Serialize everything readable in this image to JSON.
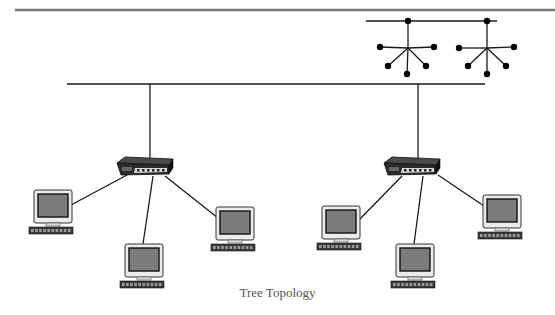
{
  "diagram": {
    "title": "Tree Topology",
    "colors": {
      "top_rule": "#777777",
      "line": "#1a1a1a",
      "node": "#000000",
      "monitor_bezel": "#ececec",
      "monitor_screen": "#7c7c7c",
      "keyboard": "#3a3a3a",
      "hub_body": "#2a2a2a",
      "hub_top": "#4a4a4a",
      "hub_panel": "#d8d8d8"
    },
    "top_rule": {
      "x1": 15,
      "y": 10,
      "x2": 555
    },
    "legend_icon": {
      "bus": {
        "x1": 366,
        "x2": 497,
        "y": 21
      },
      "stars": [
        {
          "top": [
            408,
            21
          ],
          "center": [
            408,
            48
          ],
          "leaves": [
            [
              380,
              47
            ],
            [
              434,
              47
            ],
            [
              388,
              66
            ],
            [
              426,
              66
            ],
            [
              407,
              74
            ]
          ]
        },
        {
          "top": [
            487,
            21
          ],
          "center": [
            487,
            48
          ],
          "leaves": [
            [
              459,
              48
            ],
            [
              514,
              47
            ],
            [
              468,
              66
            ],
            [
              506,
              66
            ],
            [
              487,
              74
            ]
          ]
        }
      ]
    },
    "backbone": {
      "x1": 67,
      "x2": 485,
      "y": 84
    },
    "hubs": [
      {
        "label": "hub-1",
        "x": 117,
        "y": 157,
        "drop_x": 150,
        "computers": [
          {
            "label": "pc-1",
            "x": 29,
            "y": 190,
            "link_from": [
              127,
              175
            ],
            "link_to": [
              71,
              205
            ]
          },
          {
            "label": "pc-2",
            "x": 120,
            "y": 244,
            "link_from": [
              153,
              176
            ],
            "link_to": [
              143,
              244
            ]
          },
          {
            "label": "pc-3",
            "x": 211,
            "y": 207,
            "link_from": [
              165,
              176
            ],
            "link_to": [
              218,
              218
            ]
          }
        ]
      },
      {
        "label": "hub-2",
        "x": 384,
        "y": 157,
        "drop_x": 418,
        "computers": [
          {
            "label": "pc-4",
            "x": 317,
            "y": 206,
            "link_from": [
              402,
              176
            ],
            "link_to": [
              357,
              222
            ]
          },
          {
            "label": "pc-5",
            "x": 391,
            "y": 244,
            "link_from": [
              423,
              176
            ],
            "link_to": [
              414,
              244
            ]
          },
          {
            "label": "pc-6",
            "x": 478,
            "y": 195,
            "link_from": [
              438,
              175
            ],
            "link_to": [
              484,
              206
            ]
          }
        ]
      }
    ]
  }
}
